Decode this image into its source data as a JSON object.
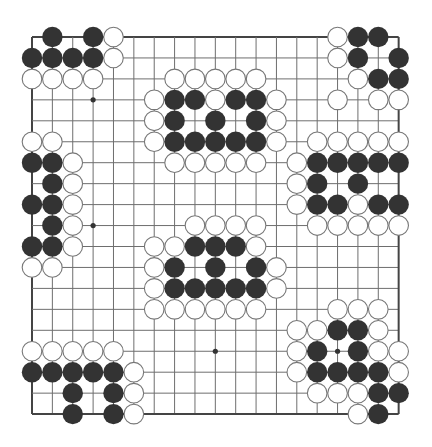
{
  "board": {
    "size": 19,
    "origin_x": 32,
    "origin_y": 37,
    "spacing_x": 20.37,
    "spacing_y": 20.95,
    "stone_radius": 9.8,
    "colors": {
      "background": "#ffffff",
      "grid_line": "#6e6e6e",
      "border_line": "#444444",
      "black_stone": "#333333",
      "white_stone_fill": "#ffffff",
      "white_stone_stroke": "#777777",
      "star_point": "#333333"
    },
    "star_points": [
      [
        3,
        3
      ],
      [
        3,
        9
      ],
      [
        9,
        15
      ],
      [
        15,
        15
      ]
    ],
    "groups": [
      {
        "name": "top-left-corner",
        "black": [
          [
            1,
            0
          ],
          [
            3,
            0
          ],
          [
            0,
            1
          ],
          [
            1,
            1
          ],
          [
            2,
            1
          ],
          [
            3,
            1
          ]
        ],
        "white": [
          [
            4,
            0
          ],
          [
            4,
            1
          ],
          [
            0,
            2
          ],
          [
            1,
            2
          ],
          [
            2,
            2
          ],
          [
            3,
            2
          ]
        ]
      },
      {
        "name": "top-center",
        "black": [
          [
            7,
            3
          ],
          [
            8,
            3
          ],
          [
            10,
            3
          ],
          [
            11,
            3
          ],
          [
            7,
            4
          ],
          [
            9,
            4
          ],
          [
            11,
            4
          ],
          [
            7,
            5
          ],
          [
            8,
            5
          ],
          [
            9,
            5
          ],
          [
            10,
            5
          ],
          [
            11,
            5
          ]
        ],
        "white": [
          [
            7,
            2
          ],
          [
            8,
            2
          ],
          [
            9,
            2
          ],
          [
            10,
            2
          ],
          [
            11,
            2
          ],
          [
            6,
            3
          ],
          [
            9,
            3
          ],
          [
            12,
            3
          ],
          [
            6,
            4
          ],
          [
            12,
            4
          ],
          [
            6,
            5
          ],
          [
            12,
            5
          ],
          [
            7,
            6
          ],
          [
            8,
            6
          ],
          [
            9,
            6
          ],
          [
            10,
            6
          ],
          [
            11,
            6
          ]
        ]
      },
      {
        "name": "top-right-corner",
        "black": [
          [
            16,
            0
          ],
          [
            17,
            0
          ],
          [
            16,
            1
          ],
          [
            18,
            1
          ],
          [
            17,
            2
          ],
          [
            18,
            2
          ]
        ],
        "white": [
          [
            15,
            0
          ],
          [
            15,
            1
          ],
          [
            16,
            2
          ],
          [
            15,
            3
          ],
          [
            17,
            3
          ],
          [
            18,
            3
          ]
        ]
      },
      {
        "name": "right-side",
        "black": [
          [
            14,
            6
          ],
          [
            15,
            6
          ],
          [
            16,
            6
          ],
          [
            17,
            6
          ],
          [
            18,
            6
          ],
          [
            14,
            7
          ],
          [
            16,
            7
          ],
          [
            14,
            8
          ],
          [
            15,
            8
          ],
          [
            17,
            8
          ],
          [
            18,
            8
          ]
        ],
        "white": [
          [
            14,
            5
          ],
          [
            15,
            5
          ],
          [
            16,
            5
          ],
          [
            17,
            5
          ],
          [
            18,
            5
          ],
          [
            13,
            6
          ],
          [
            13,
            7
          ],
          [
            13,
            8
          ],
          [
            16,
            8
          ],
          [
            14,
            9
          ],
          [
            15,
            9
          ],
          [
            16,
            9
          ],
          [
            17,
            9
          ],
          [
            18,
            9
          ]
        ]
      },
      {
        "name": "left-side",
        "black": [
          [
            0,
            6
          ],
          [
            1,
            6
          ],
          [
            1,
            7
          ],
          [
            0,
            8
          ],
          [
            1,
            8
          ],
          [
            1,
            9
          ],
          [
            0,
            10
          ],
          [
            1,
            10
          ]
        ],
        "white": [
          [
            0,
            5
          ],
          [
            1,
            5
          ],
          [
            2,
            6
          ],
          [
            2,
            7
          ],
          [
            2,
            8
          ],
          [
            2,
            9
          ],
          [
            2,
            10
          ],
          [
            0,
            11
          ],
          [
            1,
            11
          ]
        ]
      },
      {
        "name": "center",
        "black": [
          [
            8,
            10
          ],
          [
            9,
            10
          ],
          [
            10,
            10
          ],
          [
            7,
            11
          ],
          [
            9,
            11
          ],
          [
            11,
            11
          ],
          [
            7,
            12
          ],
          [
            8,
            12
          ],
          [
            9,
            12
          ],
          [
            10,
            12
          ],
          [
            11,
            12
          ]
        ],
        "white": [
          [
            8,
            9
          ],
          [
            9,
            9
          ],
          [
            10,
            9
          ],
          [
            11,
            9
          ],
          [
            6,
            10
          ],
          [
            7,
            10
          ],
          [
            11,
            10
          ],
          [
            6,
            11
          ],
          [
            12,
            11
          ],
          [
            6,
            12
          ],
          [
            12,
            12
          ],
          [
            6,
            13
          ],
          [
            7,
            13
          ],
          [
            8,
            13
          ],
          [
            9,
            13
          ],
          [
            10,
            13
          ],
          [
            11,
            13
          ]
        ]
      },
      {
        "name": "bottom-right-corner",
        "black": [
          [
            15,
            14
          ],
          [
            16,
            14
          ],
          [
            14,
            15
          ],
          [
            16,
            15
          ],
          [
            14,
            16
          ],
          [
            15,
            16
          ],
          [
            16,
            16
          ],
          [
            17,
            16
          ],
          [
            17,
            17
          ],
          [
            18,
            17
          ],
          [
            17,
            18
          ]
        ],
        "white": [
          [
            15,
            13
          ],
          [
            16,
            13
          ],
          [
            17,
            13
          ],
          [
            13,
            14
          ],
          [
            14,
            14
          ],
          [
            17,
            14
          ],
          [
            13,
            15
          ],
          [
            17,
            15
          ],
          [
            18,
            15
          ],
          [
            13,
            16
          ],
          [
            18,
            16
          ],
          [
            14,
            17
          ],
          [
            15,
            17
          ],
          [
            16,
            17
          ],
          [
            16,
            18
          ]
        ]
      },
      {
        "name": "bottom-left-corner",
        "black": [
          [
            0,
            16
          ],
          [
            1,
            16
          ],
          [
            2,
            16
          ],
          [
            3,
            16
          ],
          [
            4,
            16
          ],
          [
            2,
            17
          ],
          [
            4,
            17
          ],
          [
            2,
            18
          ],
          [
            4,
            18
          ]
        ],
        "white": [
          [
            0,
            15
          ],
          [
            1,
            15
          ],
          [
            2,
            15
          ],
          [
            3,
            15
          ],
          [
            4,
            15
          ],
          [
            5,
            16
          ],
          [
            5,
            17
          ],
          [
            5,
            18
          ]
        ]
      }
    ]
  }
}
